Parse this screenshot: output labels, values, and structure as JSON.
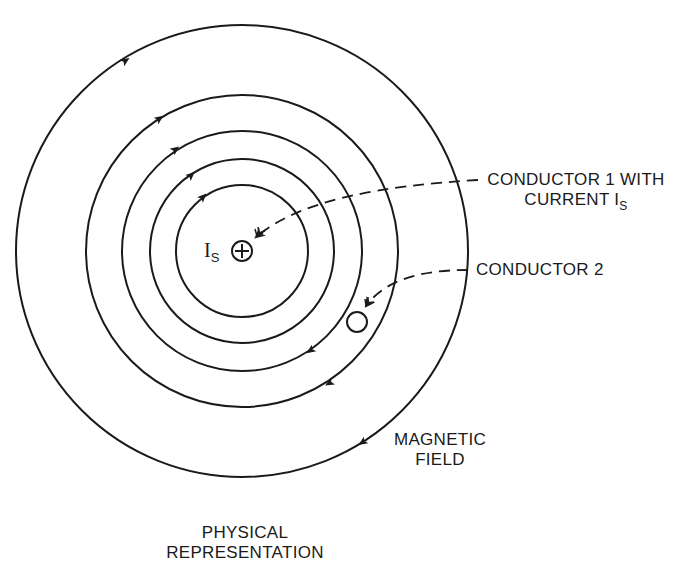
{
  "figure": {
    "title_line1": "PHYSICAL",
    "title_line2": "REPRESENTATION"
  },
  "labels": {
    "conductor1_line1": "CONDUCTOR 1 WITH",
    "conductor1_line2_prefix": "CURRENT I",
    "conductor1_line2_sub": "S",
    "conductor2": "CONDUCTOR 2",
    "field_line1": "MAGNETIC",
    "field_line2": "FIELD",
    "source_symbol": "I",
    "source_sub": "S"
  },
  "diagram": {
    "center": [
      242,
      251
    ],
    "field_line_radii": [
      66,
      92,
      120,
      156,
      226
    ],
    "field_direction": "clockwise",
    "conductor1_symbol": "plus-in-circle (current into page)",
    "conductor2_position": [
      357,
      322
    ],
    "line_color": "#1a1a1a"
  }
}
